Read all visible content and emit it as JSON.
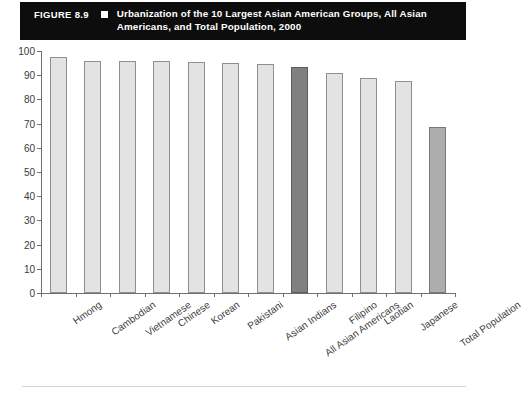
{
  "header": {
    "figure_number": "FIGURE 8.9",
    "bullet_icon": "square-bullet-icon",
    "title": "Urbanization of the 10 Largest Asian American Groups, All Asian Americans, and Total Population, 2000",
    "background_color": "#0d0d0d",
    "text_color": "#ffffff"
  },
  "colors": {
    "bar_light": "#e3e3e3",
    "bar_mid": "#aeaeae",
    "bar_dark": "#808080",
    "axis": "#6f6f6f",
    "label": "#3f3f3f"
  },
  "chart_data": {
    "type": "bar",
    "title": "Urbanization of the 10 Largest Asian American Groups, All Asian Americans, and Total Population, 2000",
    "xlabel": "",
    "ylabel": "",
    "ylim": [
      0,
      100
    ],
    "yticks": [
      0,
      10,
      20,
      30,
      40,
      50,
      60,
      70,
      80,
      90,
      100
    ],
    "ytick_labels": [
      "0",
      "10",
      "20",
      "30",
      "40",
      "50",
      "60",
      "70",
      "80",
      "90",
      "100"
    ],
    "grid": false,
    "legend": "none",
    "categories": [
      "Hmong",
      "Cambodian",
      "Vietnamese",
      "Chinese",
      "Korean",
      "Pakistani",
      "Asian Indians",
      "All Asian Americans",
      "Filipino",
      "Laotian",
      "Japanese",
      "Total Population"
    ],
    "values": [
      97.5,
      96,
      96,
      96,
      95.5,
      95,
      94.5,
      93.5,
      91,
      89,
      87.5,
      68.5
    ],
    "bar_styles": [
      "light",
      "light",
      "light",
      "light",
      "light",
      "light",
      "light",
      "dark",
      "light",
      "light",
      "light",
      "mid"
    ]
  }
}
